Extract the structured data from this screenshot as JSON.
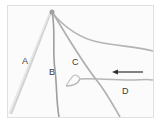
{
  "figure": {
    "background": "#ffffff",
    "frame_color": "#e2e2e2",
    "strand_color": "#a9a9a9",
    "arrow_color": "#333333",
    "labels": [
      {
        "id": "A",
        "text": "A",
        "x": 22,
        "y": 57
      },
      {
        "id": "B",
        "text": "B",
        "x": 49,
        "y": 68
      },
      {
        "id": "C",
        "text": "C",
        "x": 72,
        "y": 58
      },
      {
        "id": "D",
        "text": "D",
        "x": 122,
        "y": 87
      }
    ],
    "arrow": {
      "direction": "left",
      "from": [
        143,
        72
      ],
      "to": [
        112,
        72
      ]
    }
  }
}
